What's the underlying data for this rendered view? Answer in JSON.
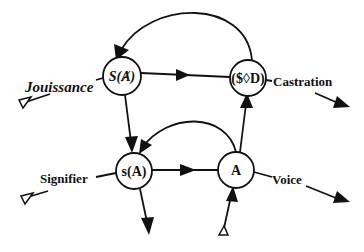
{
  "diagram": {
    "type": "graph-of-desire",
    "nodes": [
      {
        "id": "S_barred_A",
        "label": "S(Ⱥ)",
        "cx": 122,
        "cy": 76
      },
      {
        "id": "S_barred_D",
        "label": "($◊D)",
        "cx": 248,
        "cy": 78
      },
      {
        "id": "s_A",
        "label": "s(A)",
        "cx": 134,
        "cy": 171
      },
      {
        "id": "A",
        "label": "A",
        "cx": 236,
        "cy": 170
      }
    ],
    "edge_labels": {
      "jouissance": "Jouissance",
      "castration": "Castration",
      "signifier": "Signifier",
      "voice": "Voice"
    },
    "edges": [
      {
        "from": "S_barred_D",
        "to": "S_barred_A",
        "shape": "arc-over"
      },
      {
        "from": "S_barred_A",
        "to": "S_barred_D",
        "shape": "straight"
      },
      {
        "from": "S_barred_A",
        "to": "s_A",
        "shape": "straight"
      },
      {
        "from": "A",
        "to": "s_A",
        "shape": "arc-over"
      },
      {
        "from": "s_A",
        "to": "A",
        "shape": "straight"
      },
      {
        "from": "A",
        "to": "S_barred_D",
        "shape": "straight"
      },
      {
        "from": "Jouissance-start",
        "to": "S_barred_D",
        "shape": "vector-through",
        "label": "Jouissance → Castration"
      },
      {
        "from": "Signifier-start",
        "to": "A",
        "shape": "vector-through",
        "label": "Signifier → Voice"
      },
      {
        "from": "s_A",
        "to": "bottom-out",
        "shape": "straight"
      },
      {
        "from": "bottom-in",
        "to": "A",
        "shape": "straight"
      }
    ]
  }
}
